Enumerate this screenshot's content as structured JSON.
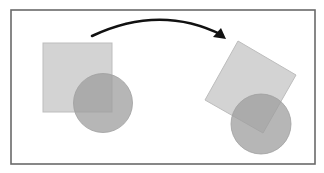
{
  "diagram": {
    "frame": {
      "x": 11,
      "y": 10,
      "width": 304,
      "height": 154,
      "stroke": "#6a6a6a",
      "stroke_width": 1.6
    },
    "colors": {
      "square_fill": "#d3d3d3",
      "square_stroke": "#bdbdbd",
      "circle_fill": "#9e9e9e",
      "circle_opacity": 0.75,
      "arrow": "#111111"
    },
    "before": {
      "square": {
        "x": 43,
        "y": 43,
        "size": 69
      },
      "circle": {
        "cx": 103,
        "cy": 103,
        "r": 29.5
      }
    },
    "after": {
      "square_points": "238,41 296,75 263,133 205,100",
      "circle": {
        "cx": 261,
        "cy": 124,
        "r": 30
      }
    },
    "arrow": {
      "path": "M92,36 Q160,4 222,35",
      "head": "226,39 213,37 221,28"
    }
  }
}
